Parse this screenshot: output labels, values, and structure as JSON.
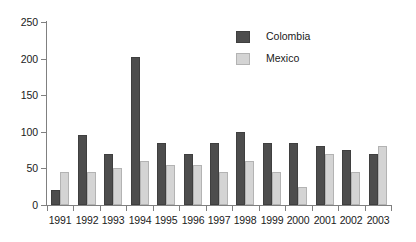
{
  "chart_data": {
    "type": "bar",
    "title": "",
    "subtitle": "",
    "xlabel": "",
    "ylabel": "",
    "ylim": [
      0,
      250
    ],
    "yticks": [
      0,
      50,
      100,
      150,
      200,
      250
    ],
    "grid": false,
    "legend_position": "inside-top-right",
    "categories": [
      "1991",
      "1992",
      "1993",
      "1994",
      "1995",
      "1996",
      "1997",
      "1998",
      "1999",
      "2000",
      "2001",
      "2002",
      "2003"
    ],
    "series": [
      {
        "name": "Colombia",
        "color": "#4d4d4d",
        "values": [
          20,
          95,
          70,
          202,
          85,
          70,
          85,
          100,
          85,
          85,
          80,
          75,
          70
        ]
      },
      {
        "name": "Mexico",
        "color": "#d4d4d4",
        "values": [
          45,
          45,
          50,
          60,
          55,
          55,
          45,
          60,
          45,
          25,
          70,
          45,
          80
        ]
      }
    ]
  },
  "legend": {
    "items": [
      {
        "label": "Colombia"
      },
      {
        "label": "Mexico"
      }
    ]
  },
  "axis": {
    "y_tick_labels": [
      "0",
      "50",
      "100",
      "150",
      "200",
      "250"
    ],
    "x_tick_labels": [
      "1991",
      "1992",
      "1993",
      "1994",
      "1995",
      "1996",
      "1997",
      "1998",
      "1999",
      "2000",
      "2001",
      "2002",
      "2003"
    ]
  }
}
